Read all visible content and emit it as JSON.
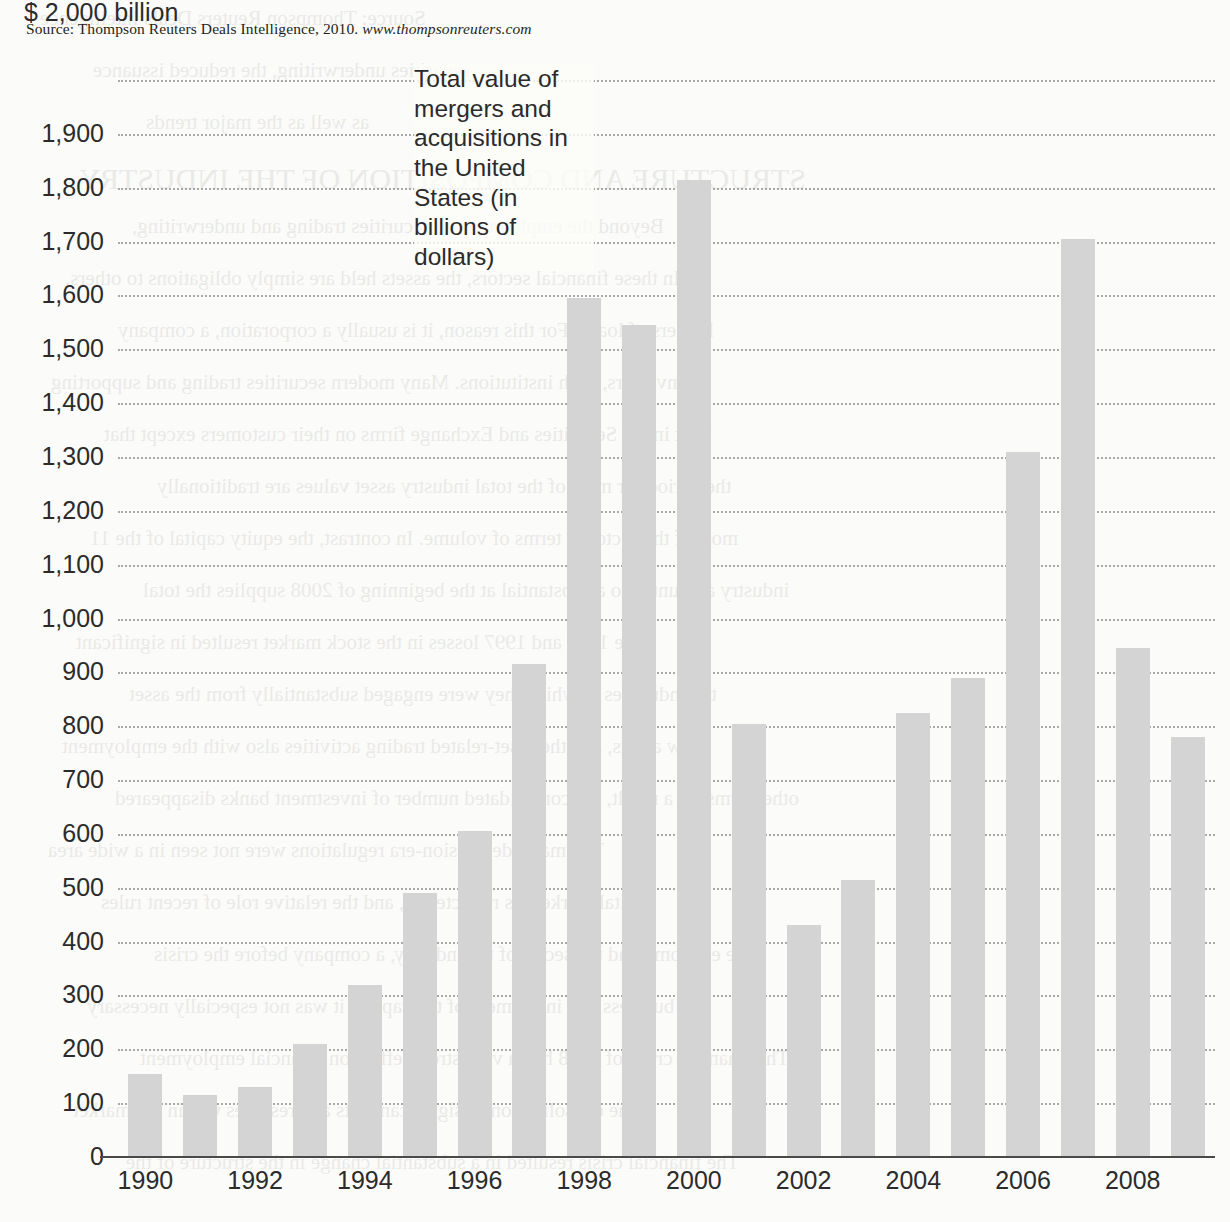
{
  "source_note": {
    "prefix": "Source: Thompson Reuters Deals Intelligence, 2010.",
    "url": "www.thompsonreuters.com"
  },
  "annotation": "Total value of mergers and acquisitions in the United States (in billions of dollars)",
  "axis": {
    "y_top_label": "$ 2,000 billion",
    "y_tick_labels": [
      "1,900",
      "1,800",
      "1,700",
      "1,600",
      "1,500",
      "1,400",
      "1,300",
      "1,200",
      "1,100",
      "1,000",
      "900",
      "800",
      "700",
      "600",
      "500",
      "400",
      "300",
      "200",
      "100",
      "0"
    ],
    "x_tick_labels": [
      "1990",
      "1992",
      "1994",
      "1996",
      "1998",
      "2000",
      "2002",
      "2004",
      "2006",
      "2008"
    ]
  },
  "colors": {
    "bar": "#d4d4d4",
    "gridline": "#9b9b9b",
    "axis": "#4a4a4a",
    "text": "#2b2b2b"
  },
  "ghost_text": [
    "Source: Thompson Reuters Deals Intelligence",
    "securities underwriting, the reduced issuance",
    "as well as the major trends",
    "STRUCTURE AND COMPOSITION OF THE INDUSTRY",
    "Beyond the employment in securities trading and underwriting,",
    "In these financial sectors, the assets held are simply obligations to others.",
    "holders of loans. For this reason, it is usually a corporation, a company",
    "investors, such institutions. Many modern securities trading and supporting",
    "kept in the Securities and Exchange firms on their customers except that",
    "the period for most of the total industry asset values are traditionally",
    "most of the sector in terms of volume. In contrast, the equity capital of the 11",
    "industry amounted to a substantial at the beginning of 2008 supplies the total",
    "The 1987 and 1997 losses in the stock market resulted in significant",
    "the industries in which they were engaged substantially from the asset",
    "new assets, and the asset-related trading activities also with the employment",
    "other firms, as a result, the consolidated number of investment banks disappeared",
    "The major depression-era regulations were not seen in a wide area",
    "capital markets as reflected in, and the relative role of recent rules",
    "The economy and the sector of the industry, a company before the crisis",
    "business and investment of the capital, it was not especially necessary",
    "The financial crisis of 2008 had a very strong effect on financial employment",
    "to the consolidation of significant acts and reserves within the market",
    "The financial crisis resulted in a substantial change in the structure of the"
  ],
  "chart_data": {
    "type": "bar",
    "title": "Total value of mergers and acquisitions in the United States (in billions of dollars)",
    "xlabel": "",
    "ylabel": "$ 2,000 billion",
    "ylim": [
      0,
      2000
    ],
    "ytick_step": 100,
    "grid": true,
    "legend": "none",
    "categories": [
      "1990",
      "1991",
      "1992",
      "1993",
      "1994",
      "1995",
      "1996",
      "1997",
      "1998",
      "1999",
      "2000",
      "2001",
      "2002",
      "2003",
      "2004",
      "2005",
      "2006",
      "2007",
      "2008",
      "2009"
    ],
    "values": [
      155,
      115,
      130,
      210,
      320,
      490,
      605,
      915,
      1595,
      1545,
      1815,
      805,
      430,
      515,
      825,
      890,
      1310,
      1705,
      945,
      780
    ]
  }
}
